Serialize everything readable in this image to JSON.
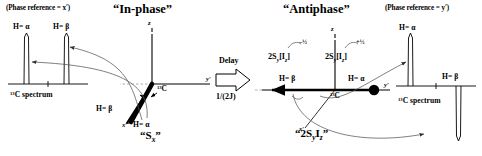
{
  "figure": {
    "domain": "NMR product-operator vector diagram",
    "background": "#ffffff",
    "ink": "#000000",
    "thin_line": "#555555"
  },
  "left_panel": {
    "phase_reference": "(Phase reference = x′)",
    "section_title": "“In-phase”",
    "spectrum": {
      "caption_pre": "13",
      "caption": "C spectrum",
      "peaks": [
        {
          "label": "H= α",
          "direction": "up"
        },
        {
          "label": "H= β",
          "direction": "up"
        }
      ]
    },
    "vector_diagram": {
      "axes": [
        "z",
        "y′",
        "x′"
      ],
      "center_label_pre": "13",
      "center_label": "C",
      "vectors": [
        {
          "label": "H= β",
          "state": "beta"
        },
        {
          "label": "H= α",
          "state": "alpha"
        }
      ],
      "state_name": "“S",
      "state_sub": "x",
      "state_close": "”"
    }
  },
  "transition": {
    "label": "Delay",
    "value": "1/(2J)",
    "arrow": "right-block-arrow"
  },
  "right_panel": {
    "phase_reference": "(Phase reference = y′)",
    "section_title": "“Antiphase”",
    "operators": [
      {
        "text_pre": "2S",
        "sub1": "y",
        "text_mid": "[I",
        "sub2": "z",
        "text_post": "]",
        "coefficient": "–½"
      },
      {
        "text_pre": "2S",
        "sub1": "y",
        "text_mid": "[I",
        "sub2": "z",
        "text_post": "]",
        "coefficient": "+½"
      }
    ],
    "vector_diagram": {
      "axes": [
        "z",
        "y′",
        "x′"
      ],
      "center_label_pre": "13",
      "center_label": "C",
      "vectors": [
        {
          "label": "H= β",
          "state": "beta",
          "direction": "minus-y"
        },
        {
          "label": "H= α",
          "state": "alpha",
          "direction": "plus-y"
        }
      ],
      "state_name": "“2S",
      "state_sub1": "y",
      "state_mid": "I",
      "state_sub2": "z",
      "state_close": "”"
    },
    "spectrum": {
      "caption_pre": "13",
      "caption": "C  spectrum",
      "peaks": [
        {
          "label": "H= α",
          "direction": "up"
        },
        {
          "label": "H= β",
          "direction": "down"
        }
      ]
    }
  }
}
